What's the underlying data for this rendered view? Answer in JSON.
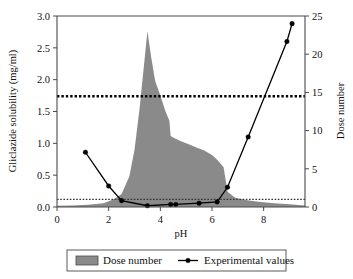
{
  "chart_data": {
    "type": "area",
    "title": "",
    "xlabel": "pH",
    "ylabel": "Gliclazide solubility (mg/ml)",
    "y2label": "Dose number",
    "xlim": [
      0,
      9.6
    ],
    "ylim": [
      0.0,
      3.0
    ],
    "y2lim": [
      0,
      25
    ],
    "grid": false,
    "legend_position": "bottom",
    "xticks": [
      "0",
      "2",
      "4",
      "6",
      "8"
    ],
    "xtick_values": [
      0,
      2,
      4,
      6,
      8
    ],
    "yticks": [
      "0.0",
      "0.5",
      "1.0",
      "1.5",
      "2.0",
      "2.5",
      "3.0"
    ],
    "ytick_values": [
      0.0,
      0.5,
      1.0,
      1.5,
      2.0,
      2.5,
      3.0
    ],
    "y2ticks": [
      "0",
      "5",
      "10",
      "15",
      "20",
      "25"
    ],
    "y2tick_values": [
      0,
      5,
      10,
      15,
      20,
      25
    ],
    "series": [
      {
        "name": "Dose number",
        "type": "area",
        "axis": "right",
        "color": "#8a8a8a",
        "x": [
          0.0,
          0.6,
          1.2,
          1.8,
          2.2,
          2.5,
          2.8,
          3.0,
          3.2,
          3.35,
          3.5,
          3.65,
          3.8,
          4.0,
          4.2,
          4.35,
          4.4,
          4.55,
          4.8,
          5.1,
          5.4,
          5.7,
          6.0,
          6.2,
          6.35,
          6.45,
          6.6,
          6.9,
          7.3,
          7.8,
          8.4,
          9.0,
          9.6
        ],
        "values": [
          0.15,
          0.2,
          0.3,
          0.5,
          1.0,
          1.7,
          4.0,
          7.5,
          13.0,
          18.0,
          23.0,
          19.5,
          16.5,
          14.6,
          12.5,
          11.3,
          9.3,
          9.0,
          8.6,
          8.2,
          7.8,
          7.4,
          6.8,
          6.2,
          5.6,
          5.2,
          2.0,
          1.2,
          0.9,
          0.7,
          0.5,
          0.35,
          0.2
        ]
      },
      {
        "name": "Experimental values",
        "type": "line",
        "axis": "left",
        "color": "#000000",
        "x": [
          1.1,
          2.0,
          2.5,
          3.5,
          4.4,
          4.6,
          5.5,
          6.2,
          6.6,
          7.4,
          8.9,
          9.1
        ],
        "values": [
          0.86,
          0.33,
          0.1,
          0.02,
          0.04,
          0.04,
          0.06,
          0.08,
          0.31,
          1.1,
          2.6,
          2.88
        ]
      }
    ],
    "reference_lines": [
      {
        "name": "upper-dose-threshold",
        "axis": "left",
        "value": 1.74,
        "y2_value": 14.5,
        "style": "thick-dashed",
        "color": "#000000"
      },
      {
        "name": "lower-dose-threshold",
        "axis": "left",
        "value": 0.12,
        "y2_value": 1.0,
        "style": "thin-dotted",
        "color": "#333333"
      }
    ]
  },
  "legend": {
    "items": [
      {
        "label": "Dose number",
        "marker": "filled-rect",
        "color": "#8a8a8a"
      },
      {
        "label": "Experimental values",
        "marker": "line-with-dot",
        "color": "#000000"
      }
    ]
  }
}
